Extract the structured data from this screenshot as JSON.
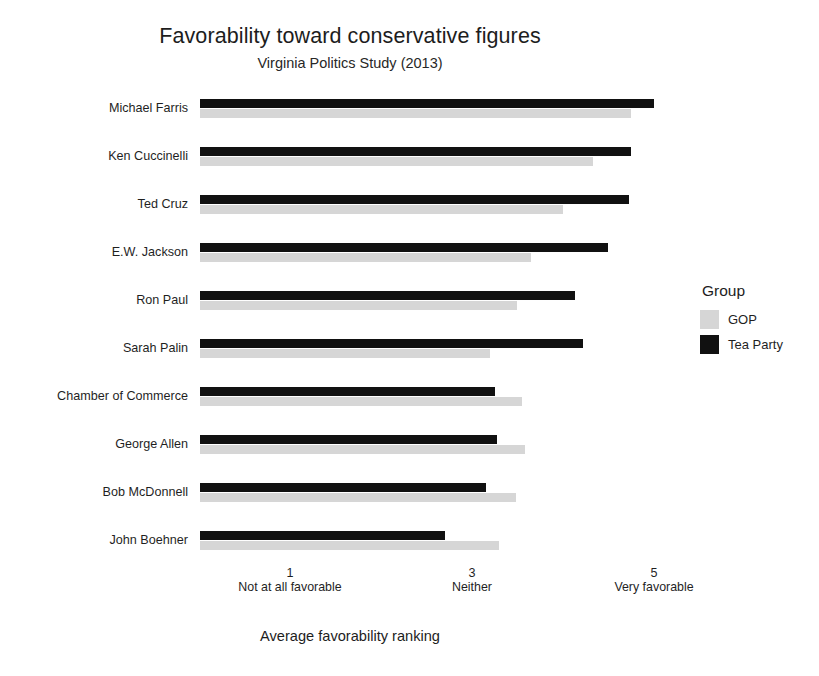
{
  "chart_data": {
    "type": "bar",
    "orientation": "horizontal",
    "title": "Favorability toward conservative figures",
    "subtitle": "Virginia Politics Study (2013)",
    "xlabel": "Average favorability ranking",
    "ylabel": "",
    "xlim": [
      0,
      5.2
    ],
    "grid": false,
    "legend_position": "right",
    "legend_title": "Group",
    "categories": [
      "Michael Farris",
      "Ken Cuccinelli",
      "Ted Cruz",
      "E.W. Jackson",
      "Ron Paul",
      "Sarah Palin",
      "Chamber of Commerce",
      "George Allen",
      "Bob McDonnell",
      "John Boehner"
    ],
    "series": [
      {
        "name": "Tea Party",
        "color": "#111111",
        "values": [
          5.0,
          4.75,
          4.72,
          4.5,
          4.13,
          4.22,
          3.25,
          3.27,
          3.15,
          2.7
        ]
      },
      {
        "name": "GOP",
        "color": "#d6d6d6",
        "values": [
          4.75,
          4.33,
          4.0,
          3.65,
          3.5,
          3.2,
          3.55,
          3.58,
          3.48,
          3.3
        ]
      }
    ],
    "xticks": [
      {
        "value": 1,
        "num": "1",
        "caption": "Not at all favorable"
      },
      {
        "value": 3,
        "num": "3",
        "caption": "Neither"
      },
      {
        "value": 5,
        "num": "5",
        "caption": "Very favorable"
      }
    ],
    "legend_entries": [
      {
        "label": "GOP",
        "color": "#d6d6d6"
      },
      {
        "label": "Tea Party",
        "color": "#111111"
      }
    ]
  }
}
